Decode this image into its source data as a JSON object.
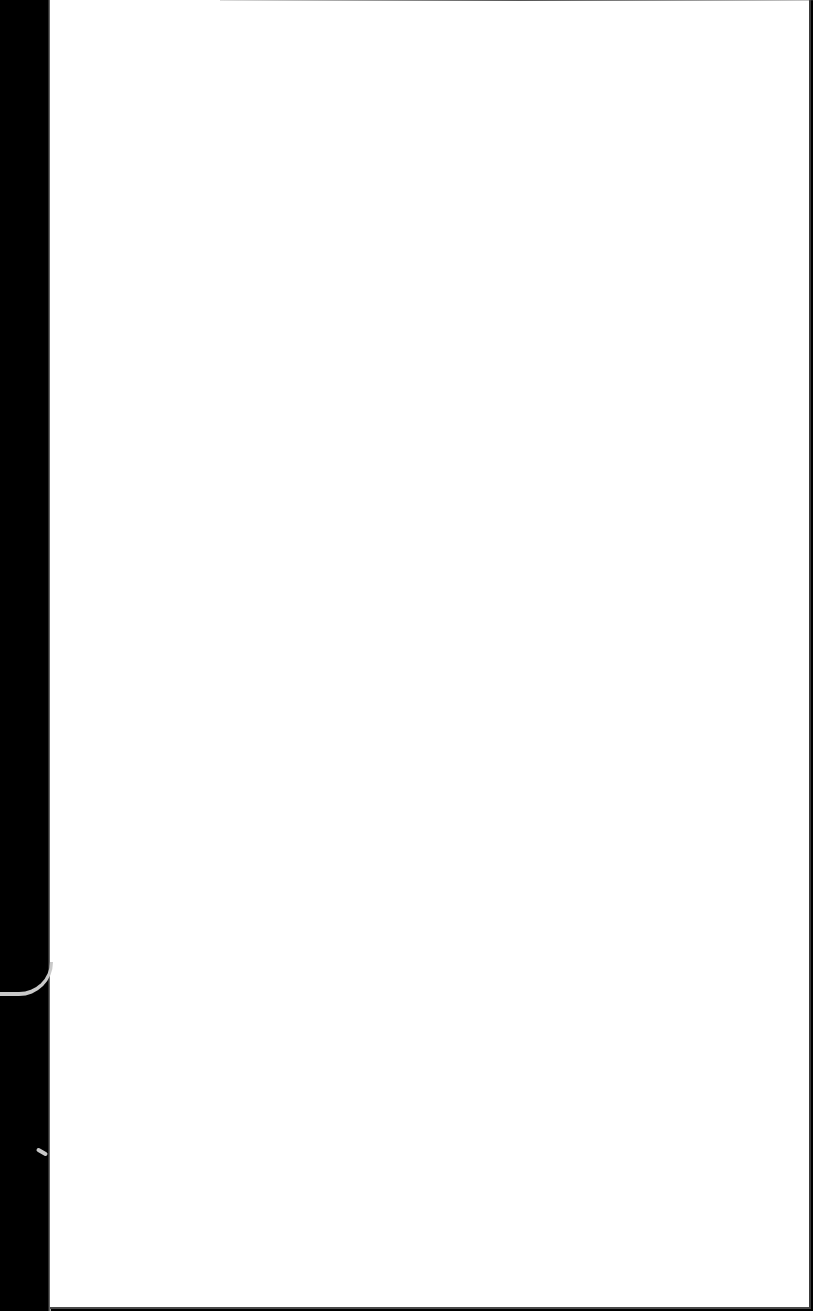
{
  "document": {
    "description": "Scanned blank page",
    "page_color": "#ffffff",
    "background_color": "#000000",
    "content": ""
  }
}
